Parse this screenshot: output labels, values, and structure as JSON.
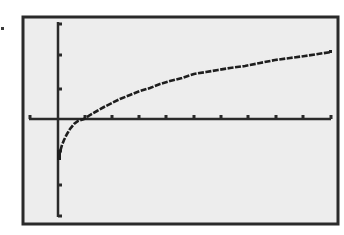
{
  "screen": {
    "type": "graphing-calculator-graph-screen",
    "background_color": "#ededed",
    "frame_color": "#2a2a2a",
    "axis_color": "#2a2a2a",
    "curve_color": "#1e1e1e"
  },
  "window": {
    "xmin": -1,
    "xmax": 10,
    "xscl": 1,
    "ymin": -3,
    "ymax": 3,
    "yscl": 1
  },
  "graph": {
    "function_label": "y = ln(x)",
    "x_ticks_px": [
      30,
      85,
      112,
      139,
      166,
      194,
      221,
      248,
      276,
      303,
      331
    ],
    "y_ticks_px": [
      24,
      55,
      89,
      151,
      185,
      216
    ],
    "curve_points_px": [
      [
        59,
        158
      ],
      [
        60,
        152
      ],
      [
        62,
        145
      ],
      [
        64,
        140
      ],
      [
        67,
        134
      ],
      [
        70,
        129
      ],
      [
        74,
        124
      ],
      [
        78,
        121
      ],
      [
        84,
        119
      ],
      [
        90,
        115
      ],
      [
        97,
        111
      ],
      [
        104,
        107
      ],
      [
        112,
        103
      ],
      [
        120,
        99
      ],
      [
        130,
        95
      ],
      [
        140,
        91
      ],
      [
        150,
        88
      ],
      [
        160,
        84
      ],
      [
        170,
        81
      ],
      [
        182,
        78
      ],
      [
        194,
        74
      ],
      [
        206,
        72
      ],
      [
        218,
        70
      ],
      [
        230,
        68
      ],
      [
        245,
        66
      ],
      [
        260,
        63
      ],
      [
        275,
        60
      ],
      [
        290,
        58
      ],
      [
        305,
        56
      ],
      [
        318,
        54
      ],
      [
        331,
        52
      ]
    ]
  }
}
